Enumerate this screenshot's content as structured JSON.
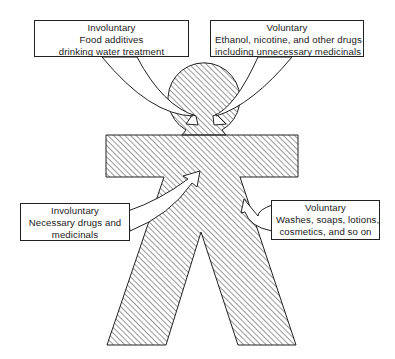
{
  "figure": {
    "colors": {
      "stroke": "#222222",
      "hatch": "#333333",
      "background": "#ffffff"
    }
  },
  "labels": {
    "top_left": {
      "category": "Involuntary",
      "lines": [
        "Food additives",
        "drinking water treatment"
      ]
    },
    "top_right": {
      "category": "Voluntary",
      "lines": [
        "Ethanol, nicotine, and other drugs",
        "including unnecessary medicinals"
      ]
    },
    "bottom_left": {
      "category": "Involuntary",
      "lines": [
        "Necessary drugs and",
        "medicinals"
      ]
    },
    "bottom_right": {
      "category": "Voluntary",
      "lines": [
        "Washes, soaps, lotions,",
        "cosmetics, and so on"
      ]
    }
  }
}
